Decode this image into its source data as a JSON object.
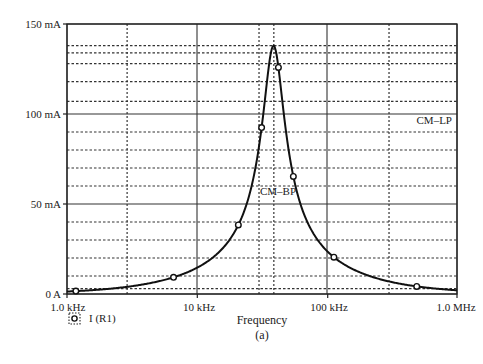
{
  "chart_data": {
    "type": "line",
    "title": "",
    "caption": "(a)",
    "xlabel": "Frequency",
    "ylabel": "",
    "xscale": "log",
    "xlim_hz": [
      1000,
      1000000
    ],
    "ylim_mA": [
      0,
      150
    ],
    "x_tick_labels": [
      "1.0 kHz",
      "10 kHz",
      "100 kHz",
      "1.0 MHz"
    ],
    "x_tick_values_hz": [
      1000,
      10000,
      100000,
      1000000
    ],
    "y_tick_labels": [
      "0 A",
      "50 mA",
      "100 mA",
      "150 mA"
    ],
    "y_tick_values_mA": [
      0,
      50,
      100,
      150
    ],
    "minor_y_gridlines_mA": [
      3,
      10,
      20,
      30,
      40,
      60,
      70,
      80,
      90,
      107,
      118,
      128,
      134,
      138
    ],
    "minor_x_gridlines_hz": [
      2900,
      30000,
      39000,
      300000
    ],
    "grid": true,
    "legend": [
      {
        "marker": "open-circle-dotted-box",
        "label": "I (R1)"
      }
    ],
    "annotations": [
      {
        "text": "CM–LP",
        "x_hz": 620000,
        "y_mA": 95
      },
      {
        "text": "CM–BP",
        "x_hz": 38000,
        "y_mA": 55
      }
    ],
    "series": [
      {
        "name": "I (R1)",
        "marker": "open-circle",
        "x_hz": [
          1170,
          6600,
          20800,
          31400,
          38800,
          42300,
          55100,
          113000,
          490000
        ],
        "y_mA": [
          2.2,
          9.4,
          36.7,
          91,
          138,
          126,
          66,
          22,
          6.7
        ],
        "marker_points": [
          {
            "x_hz": 1170,
            "y_mA": 2.2
          },
          {
            "x_hz": 6600,
            "y_mA": 9.4
          },
          {
            "x_hz": 20800,
            "y_mA": 36.7
          },
          {
            "x_hz": 31400,
            "y_mA": 91
          },
          {
            "x_hz": 42300,
            "y_mA": 126
          },
          {
            "x_hz": 55100,
            "y_mA": 66
          },
          {
            "x_hz": 113000,
            "y_mA": 22
          },
          {
            "x_hz": 490000,
            "y_mA": 6.7
          }
        ],
        "peak": {
          "x_hz": 38800,
          "y_mA": 138
        }
      }
    ]
  },
  "labels": {
    "y_150": "150 mA",
    "y_100": "100 mA",
    "y_50": "50 mA",
    "y_0": "0 A",
    "x_1k": "1.0 kHz",
    "x_10k": "10 kHz",
    "x_100k": "100 kHz",
    "x_1M": "1.0 MHz",
    "xlabel": "Frequency",
    "caption": "(a)",
    "legend_label": "I (R1)",
    "cm_lp": "CM–LP",
    "cm_bp": "CM–BP"
  }
}
